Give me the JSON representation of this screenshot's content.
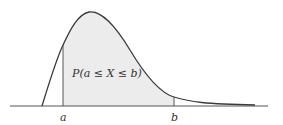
{
  "diagram": {
    "type": "probability-density-curve",
    "region_label": "P(a ≤ X ≤ b)",
    "lower_bound_label": "a",
    "upper_bound_label": "b",
    "colors": {
      "curve": "#3a3a3a",
      "shade": "#ececec",
      "axis": "#555555"
    }
  }
}
